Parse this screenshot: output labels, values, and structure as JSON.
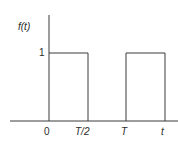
{
  "diagram": {
    "y_label": "f(t)",
    "y_tick": "1",
    "x_ticks": [
      "0",
      "T/2",
      "T",
      "t"
    ],
    "line_color": "#3a3a3a",
    "text_color": "#2a2a2a",
    "pulses": [
      {
        "start": "0",
        "end": "T/2",
        "height": "1"
      },
      {
        "start": "T",
        "end": "3T/2",
        "height": "1"
      }
    ]
  }
}
